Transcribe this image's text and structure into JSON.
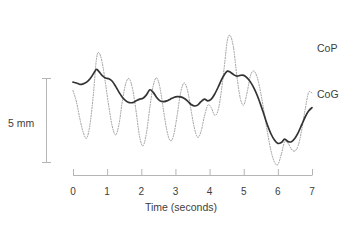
{
  "chart_data": {
    "type": "line",
    "title": "",
    "subtitle": "",
    "xlabel": "Time (seconds)",
    "ylabel": "",
    "xlim": [
      0,
      7
    ],
    "xticks": [
      0,
      1,
      2,
      3,
      4,
      5,
      6,
      7
    ],
    "xtick_labels": [
      "0",
      "1",
      "2",
      "3",
      "4",
      "5",
      "6",
      "7"
    ],
    "yaxis_visible": false,
    "grid": false,
    "legend_position": "right-inline",
    "scale_bar": {
      "label": "5 mm",
      "value": 5,
      "unit": "mm",
      "orientation": "vertical"
    },
    "series": [
      {
        "name": "CoP",
        "style": "dotted",
        "color": "#9a9a9a",
        "description": "Center of pressure: high-frequency, large-amplitude oscillation",
        "x": [
          0.0,
          0.1,
          0.2,
          0.3,
          0.4,
          0.5,
          0.6,
          0.68,
          0.75,
          0.85,
          0.95,
          1.05,
          1.15,
          1.25,
          1.35,
          1.45,
          1.55,
          1.65,
          1.75,
          1.85,
          1.95,
          2.05,
          2.15,
          2.25,
          2.35,
          2.45,
          2.55,
          2.65,
          2.75,
          2.85,
          2.95,
          3.05,
          3.15,
          3.25,
          3.35,
          3.45,
          3.55,
          3.65,
          3.75,
          3.85,
          3.95,
          4.05,
          4.15,
          4.25,
          4.35,
          4.45,
          4.52,
          4.6,
          4.7,
          4.8,
          4.9,
          5.0,
          5.1,
          5.2,
          5.3,
          5.4,
          5.5,
          5.6,
          5.7,
          5.8,
          5.9,
          6.0,
          6.1,
          6.2,
          6.3,
          6.4,
          6.5,
          6.6,
          6.7,
          6.8,
          6.9,
          7.0
        ],
        "y_mm": [
          4.55,
          3.9,
          2.9,
          2.1,
          1.75,
          2.6,
          4.4,
          6.3,
          6.8,
          6.25,
          5.0,
          3.6,
          2.45,
          1.95,
          2.6,
          4.0,
          5.0,
          5.25,
          4.6,
          3.3,
          1.85,
          1.3,
          2.05,
          3.55,
          4.85,
          5.3,
          4.7,
          3.4,
          2.2,
          1.6,
          1.95,
          3.1,
          4.4,
          5.0,
          4.6,
          3.5,
          2.4,
          1.8,
          2.15,
          3.05,
          3.7,
          3.55,
          3.1,
          3.4,
          4.6,
          6.3,
          7.5,
          7.8,
          7.1,
          5.4,
          4.1,
          3.7,
          4.45,
          5.45,
          5.7,
          5.3,
          4.4,
          3.25,
          2.05,
          1.0,
          0.35,
          0.2,
          0.8,
          1.55,
          1.45,
          1.1,
          1.0,
          1.35,
          2.25,
          3.45,
          4.45,
          4.4
        ]
      },
      {
        "name": "CoG",
        "style": "solid",
        "color": "#333333",
        "description": "Center of gravity: smoothed, lower-amplitude trajectory",
        "x": [
          0.0,
          0.1,
          0.2,
          0.3,
          0.4,
          0.5,
          0.6,
          0.68,
          0.75,
          0.85,
          0.95,
          1.05,
          1.15,
          1.25,
          1.35,
          1.45,
          1.55,
          1.65,
          1.75,
          1.85,
          1.95,
          2.05,
          2.15,
          2.25,
          2.35,
          2.45,
          2.55,
          2.65,
          2.75,
          2.85,
          2.95,
          3.05,
          3.15,
          3.25,
          3.35,
          3.45,
          3.55,
          3.65,
          3.75,
          3.85,
          3.95,
          4.05,
          4.15,
          4.25,
          4.35,
          4.45,
          4.52,
          4.6,
          4.7,
          4.8,
          4.9,
          5.0,
          5.1,
          5.2,
          5.3,
          5.4,
          5.5,
          5.6,
          5.7,
          5.8,
          5.9,
          6.0,
          6.1,
          6.2,
          6.3,
          6.4,
          6.5,
          6.6,
          6.7,
          6.8,
          6.9,
          7.0
        ],
        "y_mm": [
          5.05,
          5.0,
          4.92,
          4.95,
          5.05,
          5.25,
          5.55,
          5.8,
          5.7,
          5.45,
          5.3,
          5.25,
          5.1,
          4.8,
          4.45,
          4.15,
          3.95,
          3.85,
          3.85,
          3.95,
          4.05,
          4.1,
          4.3,
          4.6,
          4.45,
          4.15,
          3.95,
          3.9,
          3.95,
          4.05,
          4.15,
          4.2,
          4.18,
          4.1,
          3.95,
          3.75,
          3.65,
          3.7,
          3.9,
          4.05,
          3.95,
          4.05,
          4.35,
          4.75,
          5.2,
          5.55,
          5.7,
          5.65,
          5.5,
          5.4,
          5.45,
          5.45,
          5.3,
          5.05,
          4.7,
          4.25,
          3.7,
          3.1,
          2.5,
          2.0,
          1.65,
          1.45,
          1.5,
          1.7,
          1.55,
          1.55,
          1.75,
          2.1,
          2.55,
          3.0,
          3.35,
          3.55
        ]
      }
    ]
  },
  "labels": {
    "scale_bar": "5 mm",
    "axis_title": "Time (seconds)",
    "series_cop": "CoP",
    "series_cog": "CoG"
  },
  "colors": {
    "cop_line": "#9a9a9a",
    "cog_line": "#333333",
    "axis": "#b5b5b5",
    "text": "#3d3d3d",
    "background": "#ffffff"
  }
}
